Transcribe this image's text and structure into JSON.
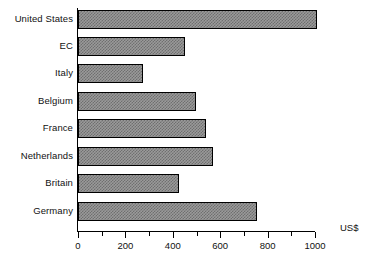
{
  "chart_data": {
    "type": "bar",
    "orientation": "horizontal",
    "title": "",
    "subtitle": "",
    "xlabel": "US$",
    "ylabel": "",
    "categories": [
      "United States",
      "EC",
      "Italy",
      "Belgium",
      "France",
      "Netherlands",
      "Britain",
      "Germany"
    ],
    "values": [
      1008,
      451,
      274,
      498,
      540,
      570,
      426,
      755
    ],
    "xlim": [
      0,
      1000
    ],
    "xticks": [
      0,
      200,
      400,
      600,
      800,
      1000
    ],
    "xtick_labels": [
      "0",
      "200",
      "400",
      "600",
      "800",
      "1000"
    ],
    "minor_tick_step": 100,
    "grid": false,
    "legend": null,
    "bar_fill": "#9a9a9a",
    "bar_hatch_color": "#6f6f6f",
    "bar_border": "#000000",
    "axis_color": "#000000",
    "background": "#ffffff"
  },
  "axis": {
    "unit_label": "US$"
  }
}
